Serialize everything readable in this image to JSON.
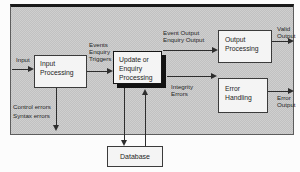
{
  "diagram": {
    "colors": {
      "panel_bg": "#c8c8c8",
      "box_bg": "#f4f4f4",
      "line": "#2d2d2d",
      "shadow": "#121212"
    },
    "boxes": {
      "input_processing": {
        "label": "Input\nProcessing"
      },
      "update_enquiry_processing": {
        "label": "Update or\nEnquiry\nProcessing"
      },
      "output_processing": {
        "label": "Output\nProcessing"
      },
      "error_handling": {
        "label": "Error\nHandling"
      },
      "database": {
        "label": "Database"
      }
    },
    "labels": {
      "input": "Input",
      "events": "Events\nEnquiry\nTriggers",
      "event_output": "Event Output\nEnquiry Output",
      "valid_output": "Valid\nOutput",
      "integrity_errors": "Integrity\nErrors",
      "error_output": "Error\nOutput",
      "control_syntax": "Control errors\nSyntax errors"
    }
  }
}
